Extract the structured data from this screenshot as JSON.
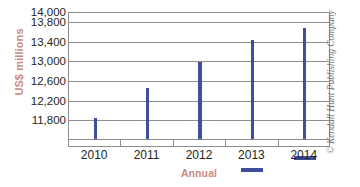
{
  "chart_data": {
    "type": "bar",
    "title": "",
    "subtitle": "",
    "xlabel": "Annual",
    "ylabel": "US$ millions",
    "categories": [
      "2010",
      "2011",
      "2012",
      "2013",
      "2014"
    ],
    "values": [
      11830,
      12430,
      12960,
      13405,
      13650
    ],
    "series": [
      {
        "name": "US$ millions",
        "values": [
          11830,
          12430,
          12960,
          13405,
          13650
        ]
      }
    ],
    "ylim": [
      11400,
      14000
    ],
    "ytick_labels": [
      "14,000",
      "13,800",
      "13,400",
      "13,000",
      "12,600",
      "12,200",
      "11,800"
    ],
    "ytick_values": [
      14000,
      13800,
      13400,
      13000,
      12600,
      12200,
      11800
    ],
    "grid": true,
    "legend": false,
    "legend_position": "none",
    "bar_color": "#3f4f9d",
    "axis_title_color": "#c98b7e",
    "gridline_color": "#8e8e90",
    "tick_label_color": "#231f20",
    "background_color": "#ffffff"
  },
  "credit": {
    "text": "© Kendall Hunt Publishing Company",
    "color": "#6d6e71"
  }
}
